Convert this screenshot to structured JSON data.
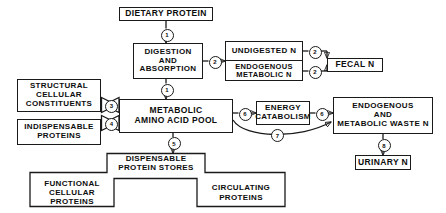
{
  "diagram": {
    "nodes": {
      "dietary_protein": "DIETARY PROTEIN",
      "digestion_absorption": "DIGESTION\nAND\nABSORPTION",
      "undigested_n": "UNDIGESTED N",
      "endogenous_metabolic_n": "ENDOGENOUS\nMETABOLIC N",
      "fecal_n": "FECAL N",
      "structural_cellular_constituents": "STRUCTURAL\nCELLULAR\nCONSTITUENTS",
      "indispensable_proteins": "INDISPENSABLE\nPROTEINS",
      "metabolic_amino_acid_pool": "METABOLIC\nAMINO ACID POOL",
      "energy_catabolism": "ENERGY\nCATABOLISM",
      "endogenous_metabolic_waste_n": "ENDOGENOUS\nAND\nMETABOLIC WASTE N",
      "urinary_n": "URINARY N",
      "dispensable_protein_stores": "DISPENSABLE\nPROTEIN STORES",
      "functional_cellular_proteins": "FUNCTIONAL\nCELLULAR PROTEINS",
      "circulating_proteins": "CIRCULATING\nPROTEINS"
    },
    "edge_labels": {
      "dietary_to_digestion": "1",
      "digestion_to_pool": "1",
      "digestion_to_undigested": "2",
      "undigested_to_fecal": "2",
      "endogenous_to_fecal": "2",
      "structural_to_pool": "3",
      "indispensable_to_pool": "4",
      "pool_to_stores": "5",
      "pool_to_catabolism": "6",
      "catabolism_to_waste": "6",
      "pool_to_waste_bypass": "7",
      "waste_to_urinary": "8"
    },
    "colors": {
      "stroke": "#1a1a1a",
      "background": "#ffffff",
      "text": "#0d0d0d"
    }
  }
}
